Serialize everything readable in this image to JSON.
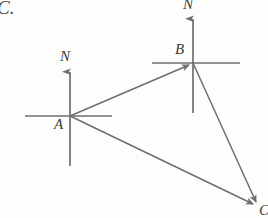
{
  "figure": {
    "caption_tag": "C.",
    "background_color": "#fdfdfc",
    "line_color": "#6e6e74",
    "label_color": "#3a3a3a",
    "points": [
      {
        "id": "A",
        "label": "A",
        "x": 70,
        "y": 116
      },
      {
        "id": "B",
        "label": "B",
        "x": 193,
        "y": 63
      },
      {
        "id": "C",
        "label": "C",
        "x": 258,
        "y": 207
      }
    ],
    "north_arrows": [
      {
        "at_point": "A",
        "label": "N",
        "tip_y": 68,
        "tail_y": 166
      },
      {
        "at_point": "B",
        "label": "N",
        "tip_y": 15,
        "tail_y": 113
      }
    ],
    "horizontal_references": [
      {
        "at_point": "A",
        "x_start": 25,
        "x_end": 112
      },
      {
        "at_point": "B",
        "x_start": 152,
        "x_end": 240
      }
    ],
    "edges": [
      {
        "from": "A",
        "to": "B",
        "arrow": true
      },
      {
        "from": "A",
        "to": "C",
        "arrow": true
      },
      {
        "from": "B",
        "to": "C",
        "arrow": true
      }
    ]
  },
  "labels": {
    "corner_tag": "C.",
    "point_a": "A",
    "point_b": "B",
    "point_c": "C",
    "north_a": "N",
    "north_b": "N"
  }
}
